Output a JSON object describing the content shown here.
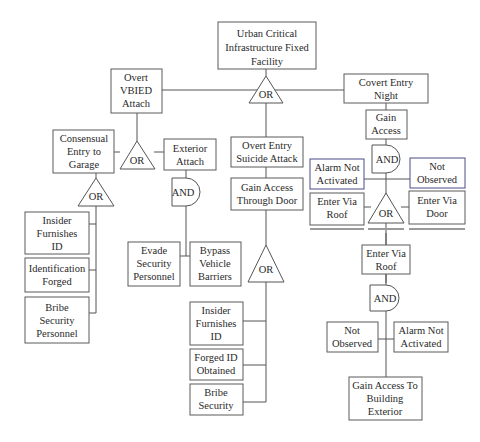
{
  "diagram": {
    "type": "attack-tree",
    "nodes": {
      "root": [
        "Urban Critical",
        "Infrastructure Fixed",
        "Facility"
      ],
      "overt_vbied": [
        "Overt",
        "VBIED",
        "Attach"
      ],
      "covert_entry": [
        "Covert Entry",
        "Night"
      ],
      "consensual_entry": [
        "Consensual",
        "Entry to",
        "Garage"
      ],
      "exterior_attach": [
        "Exterior",
        "Attach"
      ],
      "overt_entry_suicide": [
        "Overt Entry",
        "Suicide Attack"
      ],
      "gain_access_door": [
        "Gain Access",
        "Through Door"
      ],
      "gain_access": [
        "Gain",
        "Access"
      ],
      "alarm_not_activated_1": [
        "Alarm Not",
        "Activated"
      ],
      "not_observed_1": [
        "Not",
        "Observed"
      ],
      "enter_via_roof_1": [
        "Enter Via",
        "Roof"
      ],
      "enter_via_door": [
        "Enter Via",
        "Door"
      ],
      "insider_furnishes_1": [
        "Insider",
        "Furnishes",
        "ID"
      ],
      "identification_forged": [
        "Identification",
        "Forged"
      ],
      "bribe_security_personnel": [
        "Bribe",
        "Security",
        "Personnel"
      ],
      "evade_security": [
        "Evade",
        "Security",
        "Personnel"
      ],
      "bypass_barriers": [
        "Bypass",
        "Vehicle",
        "Barriers"
      ],
      "insider_furnishes_2": [
        "Insider",
        "Furnishes",
        "ID"
      ],
      "forged_id": [
        "Forged ID",
        "Obtained"
      ],
      "bribe_security": [
        "Bribe",
        "Security"
      ],
      "enter_via_roof_2": [
        "Enter Via",
        "Roof"
      ],
      "not_observed_2": [
        "Not",
        "Observed"
      ],
      "alarm_not_activated_2": [
        "Alarm Not",
        "Activated"
      ],
      "gain_access_exterior": [
        "Gain Access To",
        "Building",
        "Exterior"
      ]
    },
    "gates": {
      "root_gate": "OR",
      "vbied_gate": "OR",
      "consensual_gate": "OR",
      "exterior_gate": "AND",
      "door_gate": "OR",
      "gain_access_gate": "AND",
      "enter_gate": "OR",
      "roof_gate": "AND"
    }
  }
}
